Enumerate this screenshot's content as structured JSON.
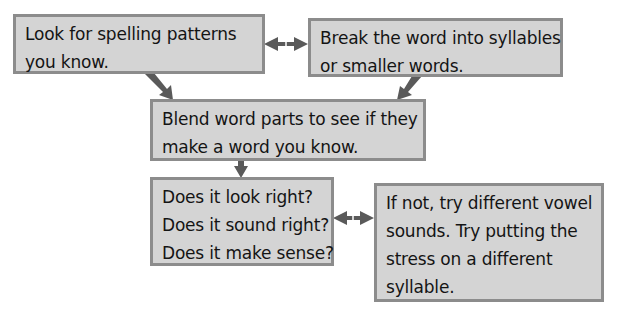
{
  "diagram": {
    "type": "flowchart",
    "colors": {
      "box_fill": "#d4d4d4",
      "box_border": "#8c8c8c",
      "text": "#141414",
      "arrow": "#5a5a5a"
    },
    "boxes": [
      {
        "id": "spelling-patterns",
        "lines": [
          "Look for spelling patterns",
          "you know."
        ]
      },
      {
        "id": "break-word",
        "lines": [
          "Break the word into syllables",
          "or smaller words."
        ]
      },
      {
        "id": "blend-parts",
        "lines": [
          "Blend word parts to see if they",
          "make a word you know."
        ]
      },
      {
        "id": "check-questions",
        "lines": [
          "Does it look right?",
          "Does it sound right?",
          "Does it make sense?"
        ]
      },
      {
        "id": "try-different",
        "lines": [
          "If not, try different vowel",
          "sounds. Try putting the",
          "stress on a different",
          "syllable."
        ]
      }
    ],
    "connectors": [
      {
        "from": "spelling-patterns",
        "to": "break-word",
        "kind": "double-arrow"
      },
      {
        "from": "spelling-patterns",
        "to": "blend-parts",
        "kind": "arrow"
      },
      {
        "from": "break-word",
        "to": "blend-parts",
        "kind": "arrow"
      },
      {
        "from": "blend-parts",
        "to": "check-questions",
        "kind": "arrow"
      },
      {
        "from": "check-questions",
        "to": "try-different",
        "kind": "double-arrow"
      }
    ]
  }
}
